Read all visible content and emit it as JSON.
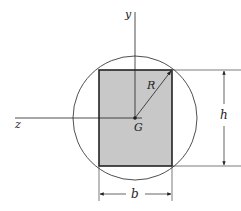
{
  "diagram": {
    "labels": {
      "y_axis": "y",
      "z_axis": "z",
      "centroid": "G",
      "radius": "R",
      "height": "h",
      "width": "b"
    },
    "colors": {
      "fill": "#c8c8c8",
      "stroke": "#222222",
      "background": "#ffffff"
    },
    "geometry": {
      "centroid": [
        135,
        118
      ],
      "circle_radius": 62,
      "rectangle": {
        "x": 99,
        "y": 70,
        "width": 73,
        "height": 96
      }
    }
  }
}
